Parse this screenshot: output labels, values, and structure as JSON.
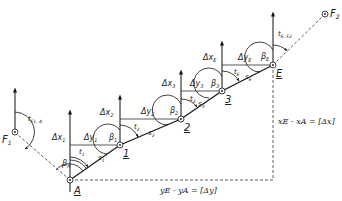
{
  "diagram": {
    "type": "traverse",
    "points": [
      {
        "id": "F1",
        "label": "F",
        "sub": "1",
        "x": 15,
        "y": 132,
        "kind": "fixed"
      },
      {
        "id": "A",
        "label": "A",
        "x": 70,
        "y": 180,
        "kind": "station"
      },
      {
        "id": "1",
        "label": "1",
        "x": 120,
        "y": 145,
        "kind": "station"
      },
      {
        "id": "2",
        "label": "2",
        "x": 181,
        "y": 119,
        "kind": "station"
      },
      {
        "id": "3",
        "label": "3",
        "x": 222,
        "y": 91,
        "kind": "station"
      },
      {
        "id": "E",
        "label": "E",
        "x": 273,
        "y": 65,
        "kind": "station"
      },
      {
        "id": "F2",
        "label": "F",
        "sub": "2",
        "x": 325,
        "y": 14,
        "kind": "fixed"
      }
    ],
    "angles": {
      "betaA": "β",
      "betaA_sub": "A",
      "beta1": "β",
      "beta1_sub": "1",
      "beta2": "β",
      "beta2_sub": "2",
      "beta3": "β",
      "beta3_sub": "3",
      "betaE": "β",
      "betaE_sub": "E"
    },
    "bearings": {
      "tF1A": "t",
      "tF1A_sub": "F1, A",
      "t1": "t",
      "t1_sub": "1",
      "t2": "t",
      "t2_sub": "2",
      "t3": "t",
      "t3_sub": "3",
      "tE": "t",
      "tE_sub": "E",
      "tEF2": "t",
      "tEF2_sub": "E, F2"
    },
    "distances": {
      "s1": "s",
      "s1_sub": "1",
      "s2": "s",
      "s2_sub": "2",
      "s3": "s",
      "s3_sub": "3",
      "sE": "s",
      "sE_sub": "E"
    },
    "deltas": {
      "dx1": "Δx",
      "dx1_sub": "1",
      "dy1": "Δy",
      "dy1_sub": "1",
      "dx2": "Δx",
      "dx2_sub": "2",
      "dy2": "Δy",
      "dy2_sub": "2",
      "dx3": "Δx",
      "dx3_sub": "3",
      "dy3": "Δy",
      "dy3_sub": "3",
      "dxE": "Δx",
      "dxE_sub": "E",
      "dyE": "Δy",
      "dyE_sub": "E"
    },
    "equations": {
      "dx_total": "xE - xA = [Δx]",
      "dy_total": "yE - yA = [Δy]"
    }
  }
}
